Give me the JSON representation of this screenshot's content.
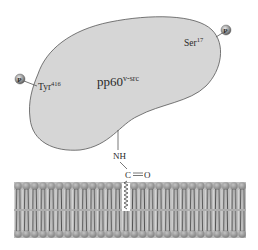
{
  "diagram": {
    "protein": {
      "label": "pp60",
      "label_superscript": "v-src",
      "fill": "#d9d9d9",
      "stroke": "#555555"
    },
    "sites": [
      {
        "residue": "Tyr",
        "number": "416",
        "phosphate_label": "P"
      },
      {
        "residue": "Ser",
        "number": "17",
        "phosphate_label": "P"
      }
    ],
    "linker": {
      "amide_nh": "NH",
      "carbonyl_c": "C",
      "carbonyl_o": "O",
      "bond": "="
    },
    "membrane": {
      "head_color": "#9a9a9a",
      "tail_color": "#6e6e6e",
      "description": "lipid bilayer"
    }
  }
}
